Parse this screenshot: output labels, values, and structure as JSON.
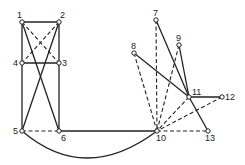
{
  "nodes": [
    {
      "id": "1",
      "x": 22,
      "y": 22,
      "lx": 17,
      "ly": 18
    },
    {
      "id": "2",
      "x": 59,
      "y": 22,
      "lx": 60,
      "ly": 18
    },
    {
      "id": "3",
      "x": 59,
      "y": 63,
      "lx": 62,
      "ly": 66
    },
    {
      "id": "4",
      "x": 22,
      "y": 63,
      "lx": 13,
      "ly": 66
    },
    {
      "id": "5",
      "x": 22,
      "y": 131,
      "lx": 13,
      "ly": 134
    },
    {
      "id": "6",
      "x": 59,
      "y": 131,
      "lx": 61,
      "ly": 141
    },
    {
      "id": "7",
      "x": 156,
      "y": 20,
      "lx": 153,
      "ly": 16
    },
    {
      "id": "8",
      "x": 134,
      "y": 53,
      "lx": 131,
      "ly": 49
    },
    {
      "id": "9",
      "x": 179,
      "y": 45,
      "lx": 176,
      "ly": 41
    },
    {
      "id": "10",
      "x": 157,
      "y": 131,
      "lx": 156,
      "ly": 141
    },
    {
      "id": "11",
      "x": 189,
      "y": 97,
      "lx": 192,
      "ly": 95
    },
    {
      "id": "12",
      "x": 222,
      "y": 97,
      "lx": 225,
      "ly": 100
    },
    {
      "id": "13",
      "x": 208,
      "y": 131,
      "lx": 205,
      "ly": 141
    }
  ],
  "edges": [
    {
      "from": "1",
      "to": "2",
      "style": "solid"
    },
    {
      "from": "1",
      "to": "4",
      "style": "solid"
    },
    {
      "from": "2",
      "to": "3",
      "style": "solid"
    },
    {
      "from": "4",
      "to": "3",
      "style": "solid"
    },
    {
      "from": "1",
      "to": "3",
      "style": "dashed"
    },
    {
      "from": "2",
      "to": "4",
      "style": "dashed"
    },
    {
      "from": "1",
      "to": "6",
      "style": "solid"
    },
    {
      "from": "2",
      "to": "5",
      "style": "solid"
    },
    {
      "from": "4",
      "to": "5",
      "style": "solid"
    },
    {
      "from": "3",
      "to": "6",
      "style": "solid"
    },
    {
      "from": "5",
      "to": "6",
      "style": "dashed"
    },
    {
      "from": "6",
      "to": "10",
      "style": "solid"
    },
    {
      "from": "7",
      "to": "10",
      "style": "dashed"
    },
    {
      "from": "7",
      "to": "11",
      "style": "solid"
    },
    {
      "from": "8",
      "to": "10",
      "style": "dashed"
    },
    {
      "from": "8",
      "to": "11",
      "style": "solid"
    },
    {
      "from": "9",
      "to": "10",
      "style": "dashed"
    },
    {
      "from": "9",
      "to": "11",
      "style": "solid"
    },
    {
      "from": "11",
      "to": "10",
      "style": "dashed"
    },
    {
      "from": "11",
      "to": "12",
      "style": "solid"
    },
    {
      "from": "12",
      "to": "10",
      "style": "dashed"
    },
    {
      "from": "11",
      "to": "13",
      "style": "solid"
    },
    {
      "from": "10",
      "to": "13",
      "style": "dashed"
    }
  ],
  "arcs": [
    {
      "from": "5",
      "to": "10",
      "style": "solid",
      "path": "M22 131 Q 85 185 157 131"
    }
  ],
  "colors": {
    "line": "#222222",
    "node_fill": "#ffffff"
  }
}
